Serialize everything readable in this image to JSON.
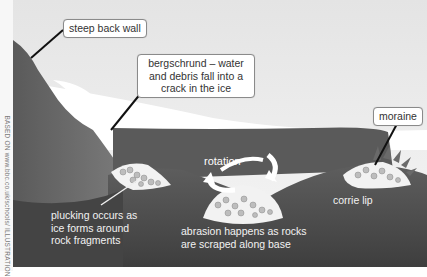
{
  "diagram": {
    "credit": "BASED ON www.bbc.co.uk/schools/ ILLUSTRATION",
    "labels": {
      "back_wall": "steep back wall",
      "bergschrund": "bergschrund – water and debris fall into a crack in the ice",
      "bergschrund_lines": [
        "bergschrund – water",
        "and debris fall into a",
        "crack in the ice"
      ],
      "moraine": "moraine",
      "rotation": "rotation",
      "plucking_lines": [
        "plucking occurs as",
        "ice forms around",
        "rock fragments"
      ],
      "abrasion_lines": [
        "abrasion happens as rocks",
        "are scraped along base"
      ],
      "corrie_lip": "corrie lip"
    },
    "colors": {
      "sky": "#e8e8e8",
      "ice": "#ffffff",
      "rock_dark": "#4a4a4a",
      "rock_mid": "#6e6e6e",
      "glacier_water": "#5c5c5c",
      "leader_line": "#111111"
    }
  }
}
